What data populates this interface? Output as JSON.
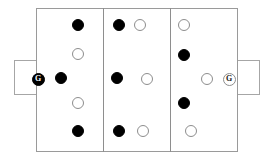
{
  "diagram": {
    "background_color": "#ffffff",
    "line_color": "#9a9a9a"
  },
  "pitch": {
    "outline": {
      "x": 36,
      "y": 8,
      "width": 202,
      "height": 144
    },
    "dividers": [
      {
        "name": "third-line-left",
        "x": 103,
        "y": 8,
        "height": 144
      },
      {
        "name": "third-line-right",
        "x": 170,
        "y": 8,
        "height": 144
      }
    ],
    "goal_boxes": [
      {
        "name": "goal-box-left",
        "side": "left",
        "x": 14,
        "y": 60,
        "width": 22,
        "height": 35
      },
      {
        "name": "goal-box-right",
        "side": "right",
        "x": 238,
        "y": 60,
        "width": 22,
        "height": 35
      }
    ]
  },
  "colors": {
    "dark_token": "#000000",
    "light_token": "#ffffff",
    "token_outline": "#8d8d8d",
    "pitch_line": "#9a9a9a"
  },
  "tokens": [
    {
      "name": "token-dark-left-top",
      "type": "dark",
      "label": "",
      "x": 78,
      "y": 25
    },
    {
      "name": "token-light-left-upper-mid",
      "type": "light",
      "label": "",
      "x": 78,
      "y": 54
    },
    {
      "name": "goalkeeper-left",
      "type": "dark",
      "label": "G",
      "x": 38,
      "y": 79,
      "keeper": true
    },
    {
      "name": "token-dark-left-mid",
      "type": "dark",
      "label": "",
      "x": 61,
      "y": 78
    },
    {
      "name": "token-light-left-lower-mid",
      "type": "light",
      "label": "",
      "x": 78,
      "y": 103
    },
    {
      "name": "token-dark-left-bottom",
      "type": "dark",
      "label": "",
      "x": 78,
      "y": 131
    },
    {
      "name": "token-dark-center-top",
      "type": "dark",
      "label": "",
      "x": 119,
      "y": 25
    },
    {
      "name": "token-light-center-top",
      "type": "light",
      "label": "",
      "x": 140,
      "y": 25
    },
    {
      "name": "token-dark-center-mid",
      "type": "dark",
      "label": "",
      "x": 117,
      "y": 78
    },
    {
      "name": "token-light-center-mid",
      "type": "light",
      "label": "",
      "x": 147,
      "y": 79
    },
    {
      "name": "token-dark-center-bottom",
      "type": "dark",
      "label": "",
      "x": 119,
      "y": 131
    },
    {
      "name": "token-light-center-bottom",
      "type": "light",
      "label": "",
      "x": 143,
      "y": 131
    },
    {
      "name": "token-light-right-top",
      "type": "light",
      "label": "",
      "x": 184,
      "y": 25
    },
    {
      "name": "token-dark-right-upper-mid",
      "type": "dark",
      "label": "",
      "x": 184,
      "y": 55
    },
    {
      "name": "token-light-right-mid",
      "type": "light",
      "label": "",
      "x": 207,
      "y": 79
    },
    {
      "name": "goalkeeper-right",
      "type": "light",
      "label": "G",
      "x": 229,
      "y": 79,
      "keeper": true
    },
    {
      "name": "token-dark-right-lower-mid",
      "type": "dark",
      "label": "",
      "x": 184,
      "y": 103
    },
    {
      "name": "token-light-right-bottom",
      "type": "light",
      "label": "",
      "x": 191,
      "y": 131
    }
  ]
}
